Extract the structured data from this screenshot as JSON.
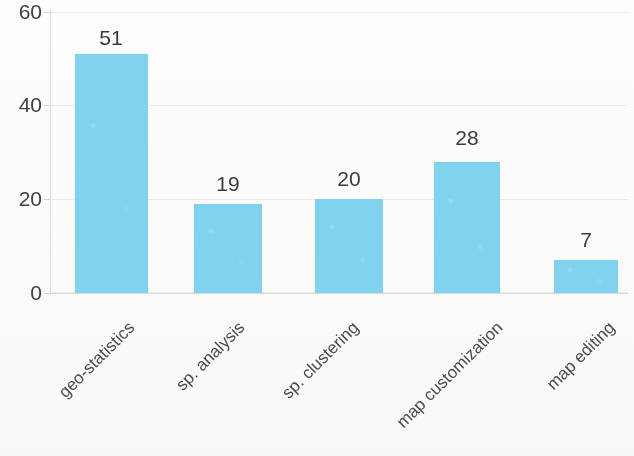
{
  "chart_data": {
    "type": "bar",
    "title": "",
    "subtitle": "",
    "xlabel": "",
    "ylabel": "",
    "categories": [
      "geo-statistics",
      "sp. analysis",
      "sp. clustering",
      "map customization",
      "map editing"
    ],
    "values": [
      51,
      19,
      20,
      28,
      7
    ],
    "value_labels": [
      "51",
      "19",
      "20",
      "28",
      "7"
    ],
    "ylim": [
      0,
      60
    ],
    "yticks": [
      0,
      20,
      40,
      60
    ],
    "ytick_labels": [
      "0",
      "20",
      "40",
      "60"
    ],
    "grid": true,
    "grid_axis": "y",
    "legend": false,
    "legend_position": "none",
    "bar_color": "#80d2ee",
    "label_rotation": -45,
    "annotations": []
  },
  "axis": {
    "y_ticks": [
      {
        "label": "60",
        "value": 60
      },
      {
        "label": "40",
        "value": 40
      },
      {
        "label": "20",
        "value": 20
      },
      {
        "label": "0",
        "value": 0
      }
    ]
  },
  "bars": [
    {
      "category": "geo-statistics",
      "value": 51,
      "label": "51"
    },
    {
      "category": "sp. analysis",
      "value": 19,
      "label": "19"
    },
    {
      "category": "sp. clustering",
      "value": 20,
      "label": "20"
    },
    {
      "category": "map customization",
      "value": 28,
      "label": "28"
    },
    {
      "category": "map editing",
      "value": 7,
      "label": "7"
    }
  ],
  "colors": {
    "bar": "#80d2ee",
    "grid": "#e9e9e9",
    "axis": "#d9d9d9",
    "text": "#404040",
    "background": "#fdfdfd"
  }
}
